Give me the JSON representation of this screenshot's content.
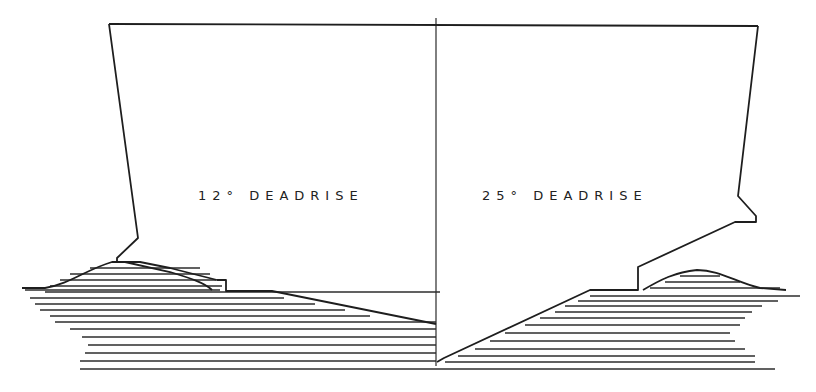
{
  "figure": {
    "left_section": {
      "label": "12° DEADRISE",
      "deadrise_deg": 12
    },
    "right_section": {
      "label": "25° DEADRISE",
      "deadrise_deg": 25
    },
    "colors": {
      "line": "#1e1e1e",
      "background": "#ffffff"
    }
  }
}
